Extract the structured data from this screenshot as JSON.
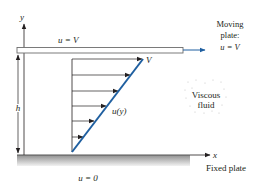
{
  "diagram": {
    "colors": {
      "profile_line": "#1f5fa0",
      "arrow_accent": "#1f5fa0",
      "lines": "#231f20",
      "plate_fill": "#a9a9a9"
    },
    "axes": {
      "y_label": "y",
      "x_label": "x"
    },
    "top_plate": {
      "label": "u = V",
      "side_label_line1": "Moving",
      "side_label_line2": "plate:",
      "side_label_line3": "u = V"
    },
    "bottom_plate": {
      "label": "u = 0",
      "side_label": "Fixed plate"
    },
    "gap": {
      "label": "h"
    },
    "profile": {
      "top_label": "V",
      "curve_label": "u(y)",
      "arrow_count": 6
    },
    "fluid": {
      "label_line1": "Viscous",
      "label_line2": "fluid"
    }
  }
}
